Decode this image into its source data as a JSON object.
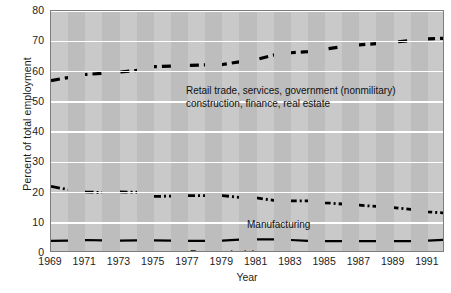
{
  "chart_data": {
    "type": "line",
    "title": "",
    "xlabel": "Year",
    "ylabel": "Percent of total employment",
    "xlim": [
      1969,
      1992
    ],
    "ylim": [
      0,
      80
    ],
    "yticks": [
      0,
      10,
      20,
      30,
      40,
      50,
      60,
      70,
      80
    ],
    "xticks": [
      1969,
      1971,
      1973,
      1975,
      1977,
      1979,
      1981,
      1983,
      1985,
      1987,
      1989,
      1991
    ],
    "grid": true,
    "legend_position": "inline-annotations",
    "background": "#c9c9c9",
    "band_color": "#bdbdbd",
    "line_color": "#000000",
    "x": [
      1969,
      1970,
      1971,
      1972,
      1973,
      1974,
      1975,
      1976,
      1977,
      1978,
      1979,
      1980,
      1981,
      1982,
      1983,
      1984,
      1985,
      1986,
      1987,
      1988,
      1989,
      1990,
      1991,
      1992
    ],
    "series": [
      {
        "name": "Retail trade, services, government (nonmilitary) construction, finance, real estate",
        "style": "dashed",
        "values": [
          57.0,
          58.0,
          59.0,
          59.4,
          59.8,
          60.4,
          61.6,
          61.8,
          62.0,
          62.2,
          62.3,
          63.2,
          64.0,
          65.4,
          66.2,
          66.6,
          67.4,
          68.2,
          68.8,
          69.2,
          69.7,
          70.2,
          70.8,
          71.0
        ]
      },
      {
        "name": "Manufacturing",
        "style": "dash-dot",
        "values": [
          22.0,
          21.0,
          20.2,
          20.0,
          20.2,
          20.1,
          18.7,
          18.8,
          19.0,
          19.0,
          19.0,
          18.4,
          18.2,
          17.4,
          17.2,
          17.2,
          16.6,
          16.2,
          15.8,
          15.4,
          15.0,
          14.4,
          13.6,
          13.2
        ]
      },
      {
        "name": "Farm and mining",
        "style": "solid",
        "values": [
          4.0,
          4.1,
          4.3,
          4.2,
          4.1,
          4.2,
          4.2,
          4.1,
          4.0,
          4.0,
          4.1,
          4.4,
          4.5,
          4.5,
          4.3,
          4.0,
          3.9,
          3.9,
          3.9,
          3.9,
          3.9,
          3.9,
          4.1,
          4.4
        ]
      }
    ]
  },
  "annotations": {
    "services_line1": "Retail trade, services, government (nonmilitary)",
    "services_line2": "construction, finance, real estate",
    "manufacturing": "Manufacturing",
    "farm": "Farm and mining"
  }
}
